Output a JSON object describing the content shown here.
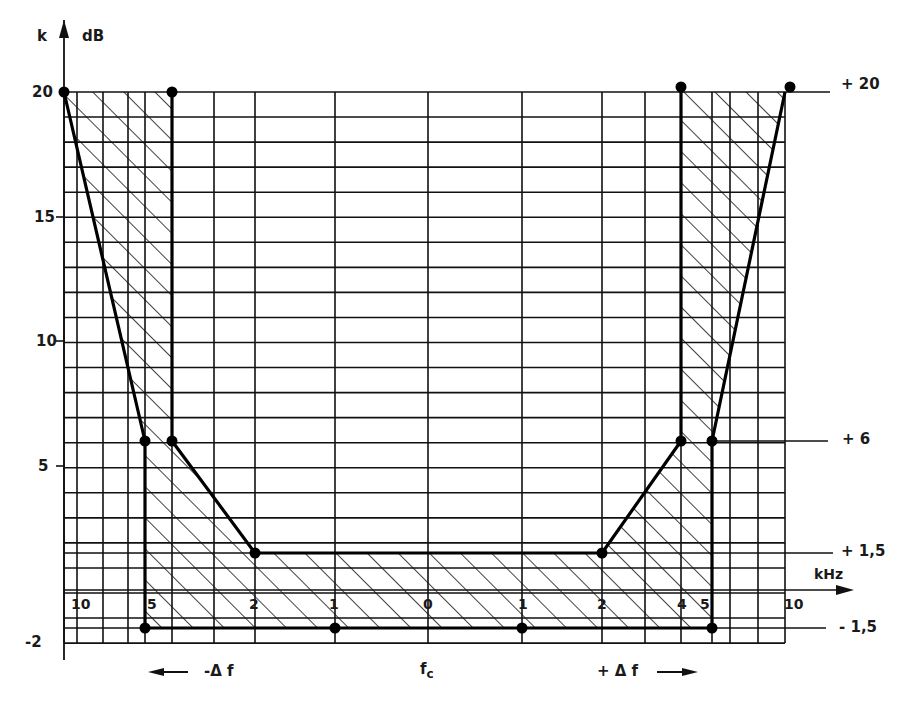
{
  "chart_data": {
    "type": "area",
    "title": "",
    "xlabel": "kHz",
    "ylabel": "dB",
    "y_axis_symbol": "k",
    "ylim": [
      -2,
      20
    ],
    "y_ticks": [
      "20",
      "15",
      "10",
      "5",
      "-2"
    ],
    "right_markers": [
      "+ 20",
      "+ 6",
      "+ 1,5",
      "- 1,5"
    ],
    "x_tick_labels": [
      "10",
      "5",
      "2",
      "1",
      "0",
      "1",
      "2",
      "4",
      "5",
      "10"
    ],
    "x_tick_offsets_khz": [
      -10,
      -5,
      -2,
      -1,
      0,
      1,
      2,
      4,
      5,
      10
    ],
    "bottom_labels": {
      "left": "-Δ f",
      "center": "f",
      "center_sub": "c",
      "right": "+ Δ f"
    },
    "grid": true,
    "series": [
      {
        "name": "outer tolerance limit",
        "points_khz_db": [
          [
            -10,
            20
          ],
          [
            -5,
            6
          ],
          [
            -5,
            -1.5
          ],
          [
            5,
            -1.5
          ],
          [
            5,
            6
          ],
          [
            10,
            20
          ]
        ]
      },
      {
        "name": "inner tolerance limit",
        "points_khz_db": [
          [
            -4,
            20
          ],
          [
            -4,
            6
          ],
          [
            -2,
            1.5
          ],
          [
            2,
            1.5
          ],
          [
            4,
            6
          ],
          [
            4,
            20
          ]
        ]
      }
    ],
    "marked_points": [
      [
        -10,
        20
      ],
      [
        -4,
        20
      ],
      [
        -5,
        6
      ],
      [
        -4,
        6
      ],
      [
        -2,
        1.5
      ],
      [
        2,
        1.5
      ],
      [
        4,
        6
      ],
      [
        5,
        6
      ],
      [
        4,
        20
      ],
      [
        10,
        20
      ],
      [
        -5,
        -1.5
      ],
      [
        -1,
        -1.5
      ],
      [
        1,
        -1.5
      ],
      [
        5,
        -1.5
      ]
    ],
    "hatched_region": "between outer and inner limits"
  },
  "labels": {
    "k": "k",
    "dB": "dB",
    "y20": "20",
    "y15": "15",
    "y10": "10",
    "y5": "5",
    "ym2": "-2",
    "r20": "+ 20",
    "r6": "+ 6",
    "r15": "+ 1,5",
    "rm15": "- 1,5",
    "khz": "kHz",
    "x_10l": "10",
    "x_5l": "5",
    "x_2l": "2",
    "x_1l": "1",
    "x_0": "0",
    "x_1r": "1",
    "x_2r": "2",
    "x_4r": "4",
    "x_5r": "5",
    "x_10r": "10",
    "minus_df": "-Δ f",
    "fc": "f",
    "fc_sub": "c",
    "plus_df": "+ Δ f"
  }
}
